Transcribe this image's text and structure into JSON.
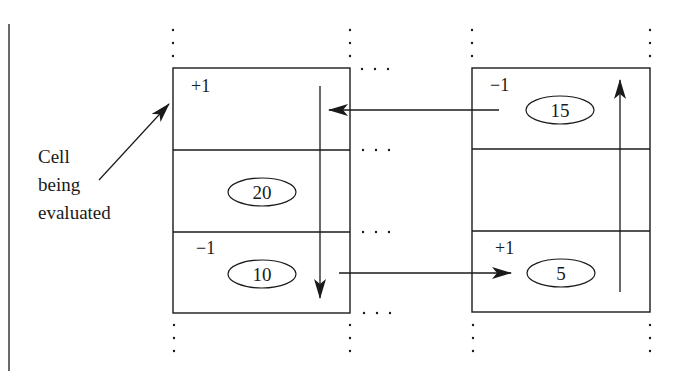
{
  "diagram": {
    "type": "cell-evaluation-diagram",
    "callout": {
      "lines": [
        "Cell",
        "being",
        "evaluated"
      ]
    },
    "left_column": {
      "cells": [
        {
          "sign": "+1",
          "value": null
        },
        {
          "sign": null,
          "value": "20"
        },
        {
          "sign": "−1",
          "value": "10"
        }
      ]
    },
    "right_column": {
      "cells": [
        {
          "sign": "−1",
          "value": "15"
        },
        {
          "sign": null,
          "value": null
        },
        {
          "sign": "+1",
          "value": "5"
        }
      ]
    },
    "arrows": [
      {
        "from": "right_column.cells.0",
        "to": "left_column.cells.0",
        "direction": "left"
      },
      {
        "from": "left_column.cells.0",
        "to": "left_column.cells.2",
        "direction": "down"
      },
      {
        "from": "left_column.cells.2",
        "to": "right_column.cells.2",
        "direction": "right"
      },
      {
        "from": "right_column.cells.2",
        "to": "right_column.cells.0",
        "direction": "up"
      }
    ],
    "colors": {
      "line": "#1a1a1a",
      "background": "#ffffff"
    }
  }
}
